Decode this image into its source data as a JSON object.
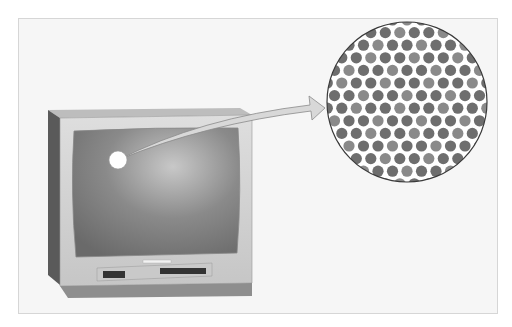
{
  "figure": {
    "tv": {
      "label": "crt-television"
    },
    "magnifier": {
      "label": "phosphor-dot-pattern",
      "dot_color_dark": "#6e6e6e",
      "dot_color_light": "#8a8a8a"
    },
    "arrow": {
      "label": "magnify-arrow"
    },
    "colors": {
      "background": "#f6f6f6",
      "frame_border": "#d6d6d6",
      "screen": "#7a7a7a",
      "bezel": "#d2d2d2"
    }
  }
}
